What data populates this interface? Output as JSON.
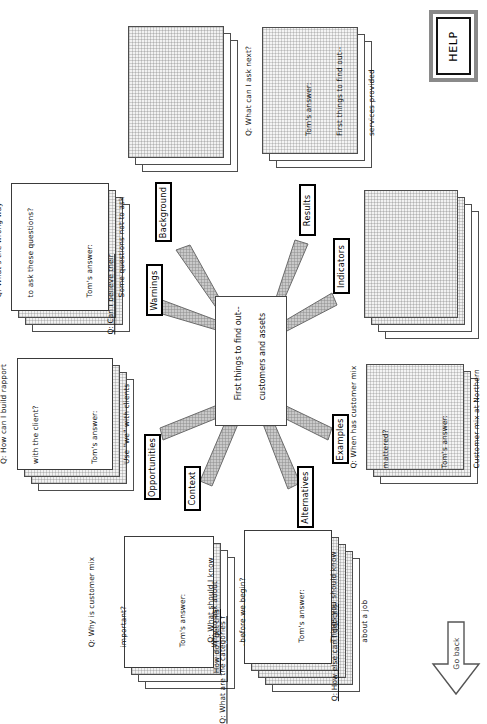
{
  "app": {
    "title": "First things to find out-- customers and assets",
    "orientation": "rotated-90",
    "colors": {
      "page_background": "#ffffff",
      "card_border": "#4d4d4d",
      "card_grid_fill": "#f2f2f2",
      "label_border": "#000000",
      "wedge_fill": "#b5b5b5",
      "help_frame": "#8a8a8a"
    }
  },
  "center_node": {
    "name": "center-node",
    "line1": "First things to find out--",
    "line2": "customers and assets"
  },
  "spokes": [
    {
      "id": "background",
      "label": "Background"
    },
    {
      "id": "results",
      "label": "Results"
    },
    {
      "id": "warnings",
      "label": "Warnings"
    },
    {
      "id": "indicators",
      "label": "Indicators"
    },
    {
      "id": "opportunities",
      "label": "Opportunities"
    },
    {
      "id": "examples",
      "label": "Examples"
    },
    {
      "id": "context",
      "label": "Context"
    },
    {
      "id": "alternatives",
      "label": "Alternatives"
    }
  ],
  "stacks": {
    "background": {
      "name": "card-stack-background",
      "sheets": 3,
      "front_text": null
    },
    "results": {
      "name": "card-stack-results",
      "sheets": 3,
      "front_text": {
        "question": "Q: What can I ask next?",
        "answer_label": "Tom's answer:",
        "answer_line1": "First things to find out--",
        "answer_line2": "services provided"
      }
    },
    "indicators": {
      "name": "card-stack-indicators",
      "sheets": 4,
      "front_text": null
    },
    "warnings": {
      "name": "card-stack-warnings",
      "sheets": 4,
      "back_text": "Q: Can I believe their",
      "front_text": {
        "question_line1": "Q: What's the wrong way",
        "question_line2": "to ask these questions?",
        "answer_label": "Tom's answer:",
        "answer_line1": "Some questions not to ask"
      }
    },
    "opportunities": {
      "name": "card-stack-opportunities",
      "sheets": 4,
      "front_text": {
        "question_line1": "Q: How can I build rapport",
        "question_line2": "with the client?",
        "answer_label": "Tom's answer:",
        "answer_line1": "Use \"we\" with clients"
      }
    },
    "examples": {
      "name": "card-stack-examples",
      "sheets": 3,
      "front_text": {
        "question_line1": "Q: When has customer mix",
        "question_line2": "mattered?",
        "answer_label": "Tom's answer:",
        "answer_line1": "Customer mix at Northern"
      }
    },
    "context": {
      "name": "card-stack-context",
      "sheets": 4,
      "back_text_1": "How do I get this",
      "back_text_2": "Q: What are the categories f",
      "front_text": {
        "question_line1": "Q: Why is customer mix",
        "question_line2": "important?",
        "answer_label": "Tom's answer:",
        "answer_line1": "Why to ask about",
        "answer_line2": "customer mix"
      }
    },
    "alternatives": {
      "name": "card-stack-alternatives",
      "sheets": 5,
      "back_text_1": "Q: How else can I get this",
      "front_text": {
        "question_line1": "Q: What should I know",
        "question_line2": "before we begin?",
        "answer_label": "Tom's answer:",
        "answer_line1": "Things you should know",
        "answer_line2": "about a job"
      }
    }
  },
  "controls": {
    "help_button": {
      "name": "help-button",
      "label": "HELP"
    },
    "go_back_button": {
      "name": "go-back-button",
      "label": "Go back",
      "icon": "arrow-down-icon"
    }
  }
}
